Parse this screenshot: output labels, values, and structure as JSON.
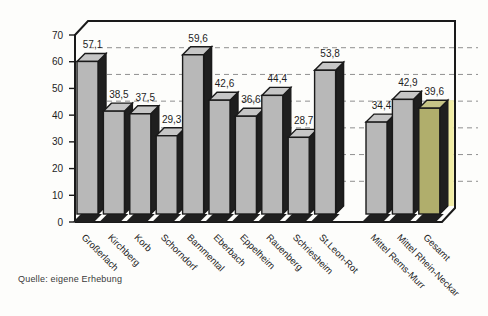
{
  "chart_data": {
    "type": "bar",
    "title": "",
    "xlabel": "",
    "ylabel": "",
    "categories": [
      "Großerlach",
      "Kirchberg",
      "Korb",
      "Schorndorf",
      "Bammental",
      "Eberbach",
      "Eppelheim",
      "Rauenberg",
      "Schriesheim",
      "St.Leon-Rot",
      "Mittel Rems-Murr",
      "Mittel Rhein-Neckar",
      "Gesamt"
    ],
    "values": [
      57.1,
      38.5,
      37.5,
      29.3,
      59.6,
      42.6,
      36.6,
      44.4,
      28.7,
      53.8,
      34.4,
      42.9,
      39.6
    ],
    "value_labels": [
      "57,1",
      "38,5",
      "37,5",
      "29,3",
      "59,6",
      "42,6",
      "36,6",
      "44,4",
      "28,7",
      "53,8",
      "34,4",
      "42,9",
      "39,6"
    ],
    "ylim": [
      0,
      70
    ],
    "yticks": [
      0,
      10,
      20,
      30,
      40,
      50,
      60,
      70
    ],
    "ytick_labels": [
      "0",
      "10",
      "20",
      "30",
      "40",
      "50",
      "60",
      "70"
    ],
    "group_split_after": 10,
    "grid": "dashed-horizontal",
    "legend": "none",
    "style": "3d-bars",
    "source": "Quelle: eigene Erhebung",
    "colors": {
      "bar_front": "#b8b8b8",
      "bar_side": "#1f1f1f",
      "bar_top": "#c6c6c6",
      "highlight_front": "#b0ae6c",
      "highlight_top": "#c6c487",
      "highlight_glow": "#f1eda6",
      "outline": "#1a1a1a",
      "grid_line": "#8f8f8f",
      "text": "#1e1e1e"
    },
    "highlight_index": 12
  }
}
